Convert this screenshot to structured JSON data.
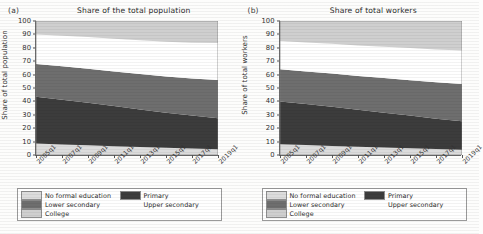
{
  "figure": {
    "panels": [
      {
        "letter": "(a)",
        "title": "Share of the total population",
        "ylabel": "Share of total population"
      },
      {
        "letter": "(b)",
        "title": "Share of total workers",
        "ylabel": "Share of total workers"
      }
    ],
    "legend": {
      "items": [
        {
          "label": "No formal education",
          "color": "#dcdcdc"
        },
        {
          "label": "Primary",
          "color": "#3c3c3c"
        },
        {
          "label": "Lower secondary",
          "color": "#6e6e6e"
        },
        {
          "label": "Upper secondary",
          "color": "#ffffff"
        },
        {
          "label": "College",
          "color": "#cfcfcf"
        }
      ]
    }
  },
  "chart_data": [
    {
      "type": "area",
      "title": "Share of the total population",
      "panel": "(a)",
      "xlabel": "",
      "ylabel": "Share of total population",
      "ylim": [
        0,
        100
      ],
      "yticks": [
        0,
        10,
        20,
        30,
        40,
        50,
        60,
        70,
        80,
        90,
        100
      ],
      "grid": false,
      "legend_position": "below",
      "stacked": true,
      "x": [
        "2005q1",
        "2007q1",
        "2009q1",
        "2011q1",
        "2013q1",
        "2015q1",
        "2017q1",
        "2019q1"
      ],
      "xticklabels": [
        "2005q1",
        "2007q1",
        "2009q1",
        "2011q1",
        "2013q1",
        "2015q1",
        "2017q1",
        "2019q1"
      ],
      "series": [
        {
          "name": "No formal education",
          "color": "#dcdcdc",
          "values": [
            8.5,
            7.8,
            7.2,
            6.6,
            6.0,
            5.4,
            4.8,
            4.2
          ]
        },
        {
          "name": "Primary",
          "color": "#3c3c3c",
          "values": [
            35.0,
            33.4,
            31.8,
            30.0,
            28.0,
            26.2,
            24.6,
            23.3
          ]
        },
        {
          "name": "Lower secondary",
          "color": "#6e6e6e",
          "values": [
            24.5,
            25.0,
            25.4,
            25.8,
            26.4,
            27.0,
            27.6,
            28.5
          ]
        },
        {
          "name": "Upper secondary",
          "color": "#ffffff",
          "values": [
            22.0,
            22.8,
            23.6,
            24.4,
            25.2,
            26.0,
            26.8,
            27.5
          ]
        },
        {
          "name": "College",
          "color": "#cfcfcf",
          "values": [
            10.0,
            11.0,
            12.0,
            13.2,
            14.4,
            15.4,
            16.2,
            16.5
          ]
        }
      ],
      "cumulative_tops": {
        "No formal education": [
          8.5,
          7.8,
          7.2,
          6.6,
          6.0,
          5.4,
          4.8,
          4.2
        ],
        "Primary": [
          43.5,
          41.2,
          39.0,
          36.6,
          34.0,
          31.6,
          29.4,
          27.5
        ],
        "Lower secondary": [
          68.0,
          66.2,
          64.4,
          62.4,
          60.4,
          58.6,
          57.0,
          56.0
        ],
        "Upper secondary": [
          90.0,
          89.0,
          88.0,
          86.8,
          85.6,
          84.6,
          83.8,
          83.5
        ],
        "College": [
          100,
          100,
          100,
          100,
          100,
          100,
          100,
          100
        ]
      }
    },
    {
      "type": "area",
      "title": "Share of total workers",
      "panel": "(b)",
      "xlabel": "",
      "ylabel": "Share of total workers",
      "ylim": [
        0,
        100
      ],
      "yticks": [
        0,
        10,
        20,
        30,
        40,
        50,
        60,
        70,
        80,
        90,
        100
      ],
      "grid": false,
      "legend_position": "below",
      "stacked": true,
      "x": [
        "2005q1",
        "2007q1",
        "2009q1",
        "2011q1",
        "2013q1",
        "2015q1",
        "2017q1",
        "2019q1"
      ],
      "xticklabels": [
        "2005q1",
        "2007q1",
        "2009q1",
        "2011q1",
        "2013q1",
        "2015q1",
        "2017q1",
        "2019q1"
      ],
      "series": [
        {
          "name": "No formal education",
          "color": "#dcdcdc",
          "values": [
            8.0,
            7.4,
            6.8,
            6.2,
            5.6,
            5.0,
            4.5,
            4.0
          ]
        },
        {
          "name": "Primary",
          "color": "#3c3c3c",
          "values": [
            32.0,
            30.6,
            29.2,
            27.6,
            26.0,
            24.4,
            22.6,
            21.2
          ]
        },
        {
          "name": "Lower secondary",
          "color": "#6e6e6e",
          "values": [
            24.0,
            24.4,
            24.8,
            25.2,
            25.8,
            26.4,
            27.1,
            27.8
          ]
        },
        {
          "name": "Upper secondary",
          "color": "#ffffff",
          "values": [
            21.0,
            21.6,
            22.2,
            22.8,
            23.4,
            24.0,
            24.6,
            25.0
          ]
        },
        {
          "name": "College",
          "color": "#cfcfcf",
          "values": [
            15.0,
            16.0,
            17.0,
            18.2,
            19.2,
            20.2,
            21.2,
            22.0
          ]
        }
      ],
      "cumulative_tops": {
        "No formal education": [
          8.0,
          7.4,
          6.8,
          6.2,
          5.6,
          5.0,
          4.5,
          4.0
        ],
        "Primary": [
          40.0,
          38.0,
          36.0,
          33.8,
          31.6,
          29.4,
          27.1,
          25.2
        ],
        "Lower secondary": [
          64.0,
          62.4,
          60.8,
          59.0,
          57.4,
          55.8,
          54.2,
          53.0
        ],
        "Upper secondary": [
          85.0,
          84.0,
          83.0,
          81.8,
          80.8,
          79.8,
          78.8,
          78.0
        ],
        "College": [
          100,
          100,
          100,
          100,
          100,
          100,
          100,
          100
        ]
      }
    }
  ]
}
